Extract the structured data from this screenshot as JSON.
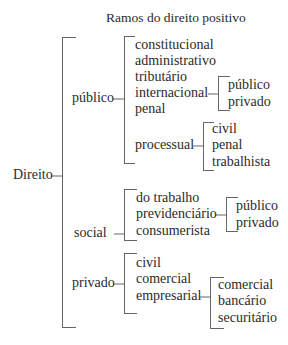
{
  "title": "Ramos do direito positivo",
  "root": "Direito",
  "branches": {
    "publico": {
      "label": "público",
      "items": [
        "constitucional",
        "administrativo",
        "tributário",
        "internacional",
        "penal",
        "processual"
      ],
      "internacional_sub": [
        "público",
        "privado"
      ],
      "processual_sub": [
        "civil",
        "penal",
        "trabalhista"
      ]
    },
    "social": {
      "label": "social",
      "items": [
        "do trabalho",
        "previdenciário",
        "consumerista"
      ],
      "previdenciario_sub": [
        "público",
        "privado"
      ]
    },
    "privado": {
      "label": "privado",
      "items": [
        "civil",
        "comercial",
        "empresarial"
      ],
      "empresarial_sub": [
        "comercial",
        "bancário",
        "securitário"
      ]
    }
  }
}
